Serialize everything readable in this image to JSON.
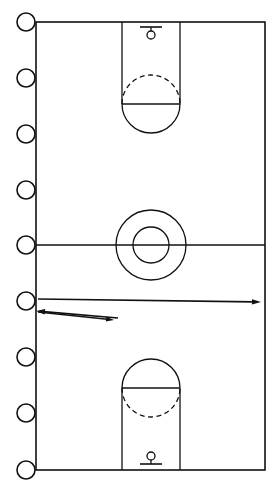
{
  "page": {
    "background_color": "#ffffff",
    "ink_color": "#111111",
    "width": 278,
    "height": 489
  },
  "notebook": {
    "binding_holes_label": "spiral-binding-holes",
    "hole_count": 9,
    "hole_radius": 9,
    "hole_center_x": 26,
    "hole_centers_y": [
      22,
      78,
      134,
      190,
      245,
      301,
      357,
      413,
      470
    ],
    "hole_stroke_color": "#111111",
    "hole_fill_color": "#ffffff"
  },
  "court": {
    "label": "Basketball court",
    "outline": {
      "x": 36,
      "y": 22,
      "width": 229,
      "height": 448
    },
    "stroke_color": "#111111",
    "stroke_width": 1.6,
    "fill_color": "#ffffff",
    "halfcourt_line": {
      "y": 245,
      "x1": 36,
      "x2": 265,
      "label": "Half court line"
    },
    "center_circle_outer": {
      "cx": 151,
      "cy": 245,
      "r": 35,
      "label": "Center circle"
    },
    "center_circle_inner": {
      "cx": 151,
      "cy": 245,
      "r": 18,
      "label": "Center jump circle"
    }
  },
  "top_key": {
    "label": "Top key / painted lane",
    "lane": {
      "x": 122,
      "y": 22,
      "width": 58,
      "height": 82
    },
    "free_throw_line": {
      "y": 104,
      "x1": 122,
      "x2": 180,
      "label": "Free throw line"
    },
    "free_throw_circle": {
      "cx": 151,
      "cy": 104,
      "r": 29
    },
    "dashed_half": "top",
    "dash_pattern": "5,3.5",
    "hoop": {
      "label": "Top basket",
      "backboard": {
        "y": 27,
        "x1": 140,
        "x2": 162
      },
      "rim": {
        "cx": 151,
        "cy": 35,
        "r": 4
      },
      "stem": {
        "x": 151,
        "y1": 27,
        "y2": 31
      }
    }
  },
  "bottom_key": {
    "label": "Bottom key / painted lane",
    "lane": {
      "x": 122,
      "y": 388,
      "width": 58,
      "height": 82
    },
    "free_throw_line": {
      "y": 388,
      "x1": 122,
      "x2": 180,
      "label": "Free throw line"
    },
    "free_throw_circle": {
      "cx": 151,
      "cy": 388,
      "r": 29
    },
    "dashed_half": "bottom",
    "dash_pattern": "5,3.5",
    "hoop": {
      "label": "Bottom basket",
      "backboard": {
        "y": 464,
        "x1": 140,
        "x2": 162
      },
      "rim": {
        "cx": 151,
        "cy": 456,
        "r": 4
      },
      "stem": {
        "x": 151,
        "y1": 460,
        "y2": 464
      }
    }
  },
  "arrows": [
    {
      "name": "long-pass-arrow-right",
      "label": "Long arrow to right sideline",
      "x1": 38,
      "y1": 299,
      "x2": 261,
      "y2": 302,
      "direction": "right",
      "head_size": 9,
      "stroke_width": 1.6
    },
    {
      "name": "return-arrow-left",
      "label": "Arrow back to left sideline",
      "x1": 118,
      "y1": 318,
      "x2": 36,
      "y2": 311,
      "direction": "left",
      "head_size": 9,
      "stroke_width": 1.6
    },
    {
      "name": "short-cut-arrow-right",
      "label": "Short arrow to the right",
      "x1": 38,
      "y1": 312,
      "x2": 114,
      "y2": 320,
      "direction": "right",
      "head_size": 8,
      "stroke_width": 1.6
    }
  ]
}
